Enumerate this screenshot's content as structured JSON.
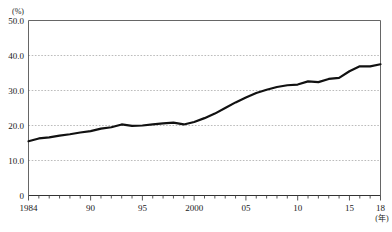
{
  "chart_data": {
    "type": "line",
    "title": "",
    "subtitle": "",
    "xlabel": "(年)",
    "ylabel": "(%)",
    "xlim": [
      1984,
      2018
    ],
    "ylim": [
      0,
      50
    ],
    "grid": true,
    "grid_axis": "y",
    "legend": false,
    "legend_position": "none",
    "y_ticks": [
      0,
      10,
      20,
      30,
      40,
      50
    ],
    "y_tick_labels": [
      "0",
      "10.0",
      "20.0",
      "30.0",
      "40.0",
      "50.0"
    ],
    "x_ticks": [
      1984,
      1985,
      1986,
      1987,
      1988,
      1989,
      1990,
      1991,
      1992,
      1993,
      1994,
      1995,
      1996,
      1997,
      1998,
      1999,
      2000,
      2001,
      2002,
      2003,
      2004,
      2005,
      2006,
      2007,
      2008,
      2009,
      2010,
      2011,
      2012,
      2013,
      2014,
      2015,
      2016,
      2017,
      2018
    ],
    "x_labeled_ticks": [
      1984,
      1990,
      1995,
      2000,
      2005,
      2010,
      2015,
      2018
    ],
    "x_tick_labels": [
      "1984",
      "90",
      "95",
      "2000",
      "05",
      "10",
      "15",
      "18"
    ],
    "line_color": "#111111",
    "line_width": 2.2,
    "grid_color": "#aaaaaa",
    "axis_color": "#555555",
    "series": [
      {
        "name": "割合",
        "x": [
          1984,
          1985,
          1986,
          1987,
          1988,
          1989,
          1990,
          1991,
          1992,
          1993,
          1994,
          1995,
          1996,
          1997,
          1998,
          1999,
          2000,
          2001,
          2002,
          2003,
          2004,
          2005,
          2006,
          2007,
          2008,
          2009,
          2010,
          2011,
          2012,
          2013,
          2014,
          2015,
          2016,
          2017,
          2018
        ],
        "values": [
          15.5,
          16.3,
          16.6,
          17.1,
          17.5,
          18.0,
          18.4,
          19.1,
          19.5,
          20.3,
          19.9,
          20.0,
          20.3,
          20.6,
          20.8,
          20.3,
          21.0,
          22.1,
          23.4,
          25.0,
          26.6,
          28.0,
          29.3,
          30.2,
          31.0,
          31.5,
          31.7,
          32.6,
          32.4,
          33.3,
          33.6,
          35.5,
          36.9,
          36.9,
          37.5
        ]
      }
    ]
  },
  "figure": {
    "y_unit_label": "(%)",
    "x_unit_label": "(年)"
  }
}
